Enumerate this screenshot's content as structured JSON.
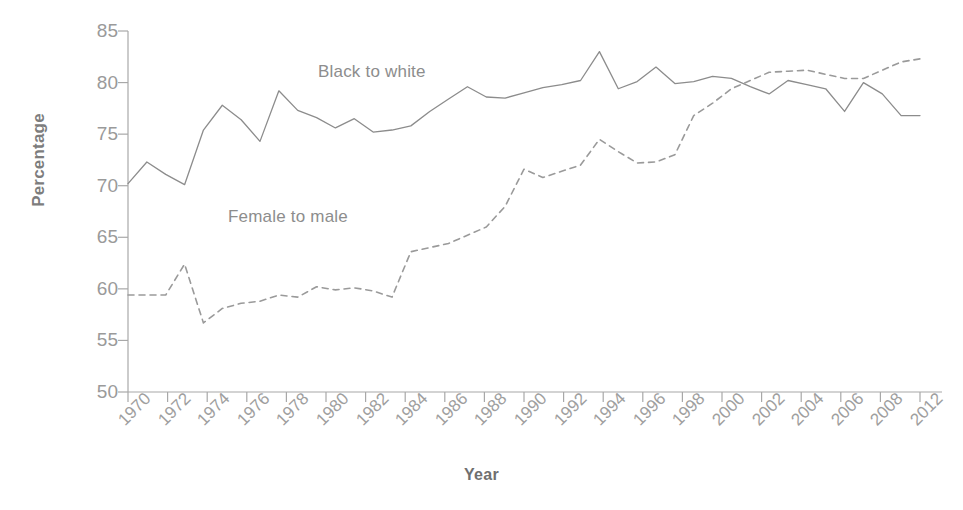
{
  "chart_data": {
    "type": "line",
    "title": "",
    "xlabel": "Year",
    "ylabel": "Percentage",
    "xlim": [
      1970,
      2012
    ],
    "ylim": [
      50,
      85
    ],
    "grid": false,
    "legend_position": "inline-annotations",
    "x_tick_labels": [
      "1970",
      "1972",
      "1974",
      "1976",
      "1978",
      "1980",
      "1982",
      "1984",
      "1986",
      "1988",
      "1990",
      "1992",
      "1994",
      "1996",
      "1998",
      "2000",
      "2002",
      "2004",
      "2006",
      "2008",
      "2012"
    ],
    "y_tick_labels": [
      "85",
      "80",
      "75",
      "70",
      "65",
      "60",
      "55",
      "50"
    ],
    "x": [
      1970,
      1971,
      1972,
      1973,
      1974,
      1975,
      1976,
      1977,
      1978,
      1979,
      1980,
      1981,
      1982,
      1983,
      1984,
      1985,
      1986,
      1987,
      1988,
      1989,
      1990,
      1991,
      1992,
      1993,
      1994,
      1995,
      1996,
      1997,
      1998,
      1999,
      2000,
      2001,
      2002,
      2003,
      2004,
      2005,
      2006,
      2007,
      2008,
      2009,
      2010,
      2011,
      2012
    ],
    "series": [
      {
        "name": "Black to white",
        "style": "solid",
        "color": "#8c8c8c",
        "annotation": "Black to white",
        "values": [
          70.2,
          72.3,
          71.1,
          70.1,
          75.4,
          77.8,
          76.4,
          74.3,
          79.2,
          77.3,
          76.6,
          75.6,
          76.5,
          75.2,
          75.4,
          75.8,
          77.2,
          78.4,
          79.6,
          78.6,
          78.5,
          79.0,
          79.5,
          79.8,
          80.2,
          83.0,
          79.4,
          80.1,
          81.5,
          79.9,
          80.1,
          80.6,
          80.4,
          79.6,
          78.9,
          80.2,
          79.8,
          79.4,
          77.2,
          80.0,
          78.9,
          76.8,
          76.8
        ]
      },
      {
        "name": "Female to male",
        "style": "dashed",
        "color": "#9a9a9a",
        "annotation": "Female to male",
        "values": [
          59.4,
          59.4,
          59.4,
          62.4,
          56.7,
          58.1,
          58.6,
          58.8,
          59.4,
          59.2,
          60.2,
          59.9,
          60.1,
          59.8,
          59.2,
          63.6,
          64.0,
          64.4,
          65.2,
          66.0,
          68.0,
          71.6,
          70.8,
          71.4,
          72.0,
          74.5,
          73.3,
          72.2,
          72.3,
          73.0,
          76.8,
          78.0,
          79.4,
          80.2,
          81.0,
          81.1,
          81.2,
          80.8,
          80.4,
          80.4,
          81.2,
          82.0,
          82.3
        ]
      }
    ]
  },
  "annotations": {
    "black_to_white": "Black to white",
    "female_to_male": "Female to male"
  },
  "axes": {
    "y_title": "Percentage",
    "x_title": "Year"
  }
}
